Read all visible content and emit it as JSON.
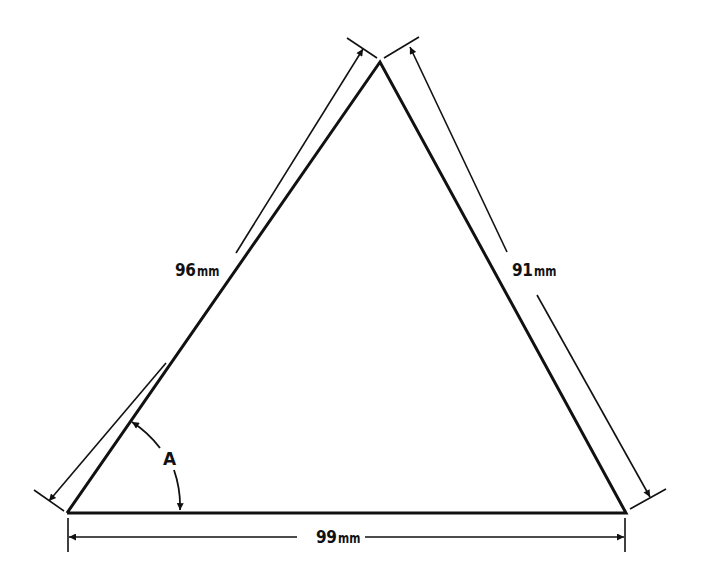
{
  "diagram": {
    "type": "triangle-dimension-drawing",
    "sides": {
      "left": {
        "value": "96",
        "unit": "mm"
      },
      "right": {
        "value": "91",
        "unit": "mm"
      },
      "bottom": {
        "value": "99",
        "unit": "mm"
      }
    },
    "angle_label": "A",
    "colors": {
      "line": "#111111",
      "background": "#ffffff"
    }
  }
}
